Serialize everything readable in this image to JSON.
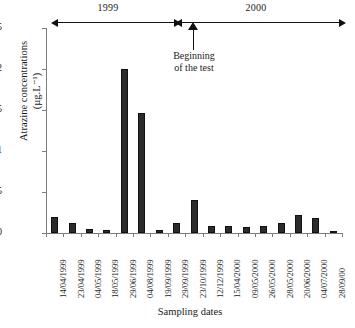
{
  "chart_data": {
    "type": "bar",
    "title": "",
    "xlabel": "Sampling dates",
    "ylabel": "Atrazine concentrations",
    "yunit": "(µg.L⁻¹)",
    "ylim": [
      0,
      2.5
    ],
    "ytick_labels": [
      "2,5",
      "2",
      "1,5",
      "1",
      "0,5",
      "0"
    ],
    "ytick_values": [
      2.5,
      2.0,
      1.5,
      1.0,
      0.5,
      0
    ],
    "grid": false,
    "legend": "none",
    "bar_color": "#2b2b2b",
    "categories": [
      "14/04/1999",
      "23/04/1999",
      "04/05/1999",
      "18/05/1999",
      "29/06/1999",
      "04/08/1999",
      "19/09/1999",
      "29/09/1999",
      "23/10/1999",
      "12/12/1999",
      "15/04/2000",
      "09/05/2000",
      "26/05/2000",
      "28/05/2000",
      "20/06/2000",
      "04/07/2000",
      "28/09/00"
    ],
    "values": [
      0.2,
      0.12,
      0.05,
      0.04,
      2.0,
      1.46,
      0.04,
      0.12,
      0.4,
      0.09,
      0.08,
      0.07,
      0.09,
      0.12,
      0.22,
      0.18,
      0.02
    ],
    "annotations": [
      {
        "name": "beginning-of-test",
        "line1": "Beginning",
        "line2": "of the test",
        "at_category": "12/12/1999"
      }
    ],
    "period_bands": [
      {
        "label": "1999",
        "start": "14/04/1999",
        "end": "12/12/1999"
      },
      {
        "label": "2000",
        "start": "15/04/2000",
        "end": "28/09/00"
      }
    ]
  }
}
